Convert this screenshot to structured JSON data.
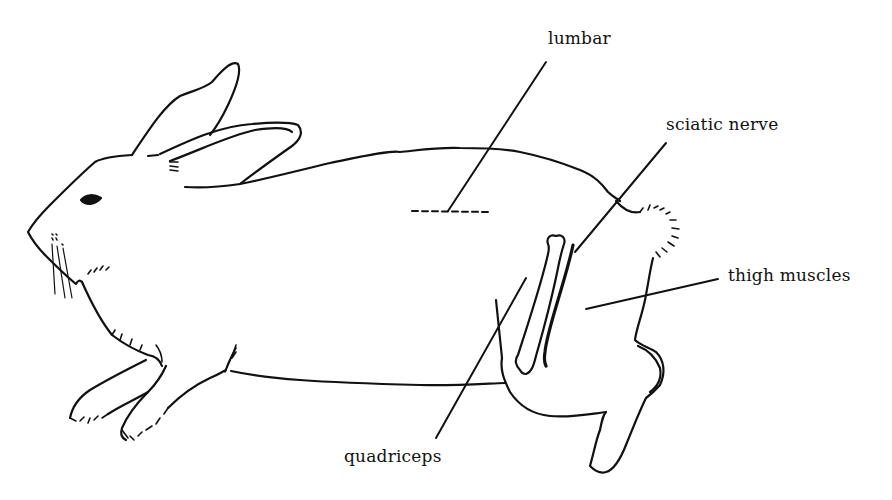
{
  "diagram": {
    "colors": {
      "line": "#111111",
      "background": "#ffffff"
    },
    "labels": {
      "lumbar": "lumbar",
      "sciatic_nerve": "sciatic nerve",
      "thigh_muscles": "thigh muscles",
      "quadriceps": "quadriceps"
    }
  }
}
